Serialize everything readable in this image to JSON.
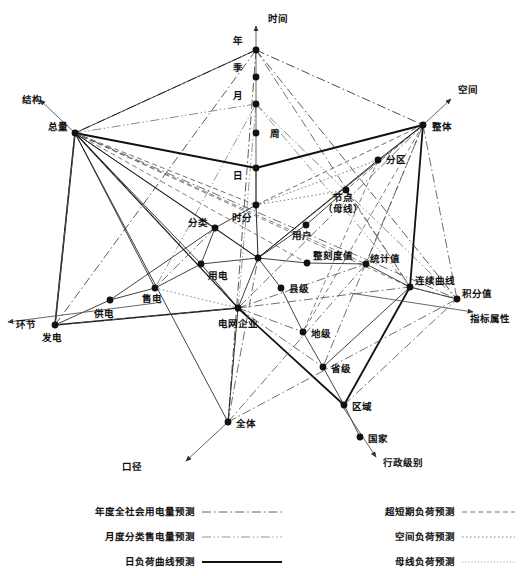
{
  "figure": {
    "title": "",
    "type": "multi-axis-network-diagram",
    "background_color": "#ffffff",
    "line_color": "#333333"
  },
  "axes": [
    {
      "id": "time",
      "label": "时间",
      "label_x": 268,
      "label_y": 22,
      "from": [
        256,
        210
      ],
      "to": [
        256,
        26
      ]
    },
    {
      "id": "structure",
      "label": "结构",
      "label_x": 22,
      "label_y": 103,
      "from": [
        75,
        133
      ],
      "to": [
        40,
        100
      ]
    },
    {
      "id": "space",
      "label": "空间",
      "label_x": 458,
      "label_y": 93,
      "from": [
        423,
        125
      ],
      "to": [
        451,
        99
      ]
    },
    {
      "id": "stage",
      "label": "环节",
      "label_x": 16,
      "label_y": 328,
      "from": [
        156,
        303
      ],
      "to": [
        8,
        322
      ]
    },
    {
      "id": "indicator",
      "label": "指标属性",
      "label_x": 470,
      "label_y": 322,
      "from": [
        350,
        293
      ],
      "to": [
        473,
        312
      ]
    },
    {
      "id": "caliber",
      "label": "口径",
      "label_x": 122,
      "label_y": 470,
      "from": [
        228,
        422
      ],
      "to": [
        186,
        461
      ]
    },
    {
      "id": "admin",
      "label": "行政级别",
      "label_x": 383,
      "label_y": 466,
      "from": [
        339,
        401
      ],
      "to": [
        376,
        457
      ]
    }
  ],
  "nodes": [
    {
      "id": "nian",
      "label": "年",
      "x": 256,
      "y": 50,
      "lx": 243,
      "ly": 44,
      "anchor": "end"
    },
    {
      "id": "ji",
      "label": "季",
      "x": 256,
      "y": 77,
      "lx": 243,
      "ly": 71,
      "anchor": "end"
    },
    {
      "id": "yue",
      "label": "月",
      "x": 256,
      "y": 104,
      "lx": 243,
      "ly": 99,
      "anchor": "end"
    },
    {
      "id": "zhou",
      "label": "周",
      "x": 256,
      "y": 133,
      "lx": 270,
      "ly": 137,
      "anchor": "start"
    },
    {
      "id": "ri",
      "label": "日",
      "x": 256,
      "y": 168,
      "lx": 243,
      "ly": 179,
      "anchor": "end"
    },
    {
      "id": "shifen",
      "label": "时分",
      "x": 256,
      "y": 205,
      "lx": 252,
      "ly": 221,
      "anchor": "end"
    },
    {
      "id": "zongliang",
      "label": "总量",
      "x": 75,
      "y": 133,
      "lx": 68,
      "ly": 130,
      "anchor": "end"
    },
    {
      "id": "zhengti",
      "label": "整体",
      "x": 423,
      "y": 125,
      "lx": 432,
      "ly": 130,
      "anchor": "start"
    },
    {
      "id": "fenqu",
      "label": "分区",
      "x": 378,
      "y": 160,
      "lx": 386,
      "ly": 163,
      "anchor": "start"
    },
    {
      "id": "jiedian",
      "label": "节点（母线）",
      "x": 346,
      "y": 190,
      "lx": 343,
      "ly": 207,
      "anchor": "middle"
    },
    {
      "id": "yonghu",
      "label": "用户",
      "x": 306,
      "y": 225,
      "lx": 302,
      "ly": 239,
      "anchor": "middle"
    },
    {
      "id": "fenlei",
      "label": "分类",
      "x": 215,
      "y": 228,
      "lx": 208,
      "ly": 226,
      "anchor": "end"
    },
    {
      "id": "yongdian",
      "label": "用电",
      "x": 201,
      "y": 264,
      "lx": 208,
      "ly": 279,
      "anchor": "start"
    },
    {
      "id": "shoudian",
      "label": "售电",
      "x": 155,
      "y": 288,
      "lx": 152,
      "ly": 302,
      "anchor": "middle"
    },
    {
      "id": "gongdian",
      "label": "供电",
      "x": 110,
      "y": 300,
      "lx": 104,
      "ly": 317,
      "anchor": "middle"
    },
    {
      "id": "fadian",
      "label": "发电",
      "x": 55,
      "y": 325,
      "lx": 52,
      "ly": 341,
      "anchor": "middle"
    },
    {
      "id": "hub",
      "label": "",
      "x": 258,
      "y": 258,
      "lx": 258,
      "ly": 258,
      "anchor": "middle"
    },
    {
      "id": "dianwang",
      "label": "电网企业",
      "x": 238,
      "y": 308,
      "lx": 238,
      "ly": 327,
      "anchor": "middle"
    },
    {
      "id": "xianji",
      "label": "县级",
      "x": 281,
      "y": 288,
      "lx": 289,
      "ly": 292,
      "anchor": "start"
    },
    {
      "id": "diji",
      "label": "地级",
      "x": 303,
      "y": 332,
      "lx": 311,
      "ly": 337,
      "anchor": "start"
    },
    {
      "id": "shengji",
      "label": "省级",
      "x": 323,
      "y": 367,
      "lx": 331,
      "ly": 372,
      "anchor": "start"
    },
    {
      "id": "quyu",
      "label": "区域",
      "x": 344,
      "y": 405,
      "lx": 352,
      "ly": 410,
      "anchor": "start"
    },
    {
      "id": "guojia",
      "label": "国家",
      "x": 360,
      "y": 437,
      "lx": 368,
      "ly": 442,
      "anchor": "start"
    },
    {
      "id": "zhengkedu",
      "label": "整刻度值",
      "x": 307,
      "y": 263,
      "lx": 333,
      "ly": 259,
      "anchor": "middle"
    },
    {
      "id": "tongji",
      "label": "统计值",
      "x": 366,
      "y": 264,
      "lx": 385,
      "ly": 262,
      "anchor": "middle"
    },
    {
      "id": "lianxu",
      "label": "连续曲线",
      "x": 410,
      "y": 287,
      "lx": 435,
      "ly": 284,
      "anchor": "middle"
    },
    {
      "id": "jifen",
      "label": "积分值",
      "x": 457,
      "y": 299,
      "lx": 477,
      "ly": 297,
      "anchor": "middle"
    },
    {
      "id": "quanti",
      "label": "全体",
      "x": 228,
      "y": 422,
      "lx": 236,
      "ly": 427,
      "anchor": "start"
    }
  ],
  "edges": [
    {
      "from": "nian",
      "to": "zongliang",
      "style": "dashdot",
      "weight": 1.0
    },
    {
      "from": "nian",
      "to": "zongliang",
      "style": "solid",
      "weight": 0.8
    },
    {
      "from": "nian",
      "to": "zhengti",
      "style": "dashdot",
      "weight": 1.0
    },
    {
      "from": "nian",
      "to": "jifen",
      "style": "dashdot",
      "weight": 0.9
    },
    {
      "from": "nian",
      "to": "quanti",
      "style": "dashdot",
      "weight": 0.9
    },
    {
      "from": "nian",
      "to": "fadian",
      "style": "dashdot",
      "weight": 0.9
    },
    {
      "from": "nian",
      "to": "lianxu",
      "style": "dashdot",
      "weight": 0.8
    },
    {
      "from": "yue",
      "to": "zongliang",
      "style": "dashdotdot",
      "weight": 0.9
    },
    {
      "from": "yue",
      "to": "jifen",
      "style": "dashdotdot",
      "weight": 0.9
    },
    {
      "from": "yue",
      "to": "lianxu",
      "style": "dashdotdot",
      "weight": 0.8
    },
    {
      "from": "yue",
      "to": "quanti",
      "style": "dashdotdot",
      "weight": 0.8
    },
    {
      "from": "yue",
      "to": "shoudian",
      "style": "dashdotdot",
      "weight": 0.8
    },
    {
      "from": "ri",
      "to": "zongliang",
      "style": "solid",
      "weight": 2.0
    },
    {
      "from": "ri",
      "to": "zhengti",
      "style": "solid",
      "weight": 2.0
    },
    {
      "from": "ri",
      "to": "shifen",
      "style": "solid",
      "weight": 0.9
    },
    {
      "from": "shifen",
      "to": "zongliang",
      "style": "dashed",
      "weight": 0.9
    },
    {
      "from": "shifen",
      "to": "zhengti",
      "style": "dashed",
      "weight": 0.9
    },
    {
      "from": "shifen",
      "to": "fenqu",
      "style": "dotted",
      "weight": 0.9
    },
    {
      "from": "shifen",
      "to": "hub",
      "style": "solid",
      "weight": 0.9
    },
    {
      "from": "shifen",
      "to": "jiedian",
      "style": "dotted",
      "weight": 0.9
    },
    {
      "from": "shifen",
      "to": "fenlei",
      "style": "solid",
      "weight": 0.8
    },
    {
      "from": "zongliang",
      "to": "fenlei",
      "style": "solid",
      "weight": 0.8
    },
    {
      "from": "zongliang",
      "to": "fadian",
      "style": "solid",
      "weight": 1.6
    },
    {
      "from": "zongliang",
      "to": "fadian",
      "style": "dashed",
      "weight": 0.8
    },
    {
      "from": "zongliang",
      "to": "fadian",
      "style": "dashdot",
      "weight": 0.8
    },
    {
      "from": "zongliang",
      "to": "dianwang",
      "style": "solid",
      "weight": 1.2
    },
    {
      "from": "zongliang",
      "to": "dianwang",
      "style": "dashed",
      "weight": 0.8
    },
    {
      "from": "zongliang",
      "to": "yongdian",
      "style": "solid",
      "weight": 0.8
    },
    {
      "from": "zongliang",
      "to": "shoudian",
      "style": "solid",
      "weight": 0.8
    },
    {
      "from": "zongliang",
      "to": "hub",
      "style": "solid",
      "weight": 0.8
    },
    {
      "from": "zongliang",
      "to": "tongji",
      "style": "dashed",
      "weight": 0.8
    },
    {
      "from": "zongliang",
      "to": "zhengkedu",
      "style": "dashed",
      "weight": 0.8
    },
    {
      "from": "zongliang",
      "to": "lianxu",
      "style": "dashed",
      "weight": 0.8
    },
    {
      "from": "zongliang",
      "to": "jifen",
      "style": "dashdot",
      "weight": 0.8
    },
    {
      "from": "zongliang",
      "to": "quanti",
      "style": "solid",
      "weight": 0.8
    },
    {
      "from": "zhengti",
      "to": "fenqu",
      "style": "solid",
      "weight": 0.8
    },
    {
      "from": "zhengti",
      "to": "jiedian",
      "style": "dashed",
      "weight": 0.8
    },
    {
      "from": "zhengti",
      "to": "lianxu",
      "style": "solid",
      "weight": 1.8
    },
    {
      "from": "zhengti",
      "to": "jifen",
      "style": "dashdot",
      "weight": 0.8
    },
    {
      "from": "zhengti",
      "to": "tongji",
      "style": "dashed",
      "weight": 0.8
    },
    {
      "from": "zhengti",
      "to": "diji",
      "style": "dashed",
      "weight": 0.8
    },
    {
      "from": "zhengti",
      "to": "shengji",
      "style": "dashdot",
      "weight": 0.8
    },
    {
      "from": "zhengti",
      "to": "hub",
      "style": "solid",
      "weight": 0.8
    },
    {
      "from": "zhengti",
      "to": "dianwang",
      "style": "dashdot",
      "weight": 0.8
    },
    {
      "from": "fenqu",
      "to": "hub",
      "style": "solid",
      "weight": 0.8
    },
    {
      "from": "fenqu",
      "to": "diji",
      "style": "dashed",
      "weight": 0.8
    },
    {
      "from": "jiedian",
      "to": "yonghu",
      "style": "solid",
      "weight": 0.8
    },
    {
      "from": "jiedian",
      "to": "lianxu",
      "style": "dashed",
      "weight": 0.8
    },
    {
      "from": "yonghu",
      "to": "hub",
      "style": "solid",
      "weight": 0.8
    },
    {
      "from": "hub",
      "to": "fenlei",
      "style": "solid",
      "weight": 0.8
    },
    {
      "from": "hub",
      "to": "yongdian",
      "style": "solid",
      "weight": 0.8
    },
    {
      "from": "hub",
      "to": "dianwang",
      "style": "solid",
      "weight": 0.8
    },
    {
      "from": "hub",
      "to": "xianji",
      "style": "solid",
      "weight": 0.8
    },
    {
      "from": "hub",
      "to": "zhengkedu",
      "style": "solid",
      "weight": 0.8
    },
    {
      "from": "fenlei",
      "to": "yongdian",
      "style": "solid",
      "weight": 0.8
    },
    {
      "from": "fenlei",
      "to": "gongdian",
      "style": "solid",
      "weight": 0.8
    },
    {
      "from": "fenlei",
      "to": "shoudian",
      "style": "dashdot",
      "weight": 0.8
    },
    {
      "from": "yongdian",
      "to": "shoudian",
      "style": "solid",
      "weight": 0.8
    },
    {
      "from": "yongdian",
      "to": "dianwang",
      "style": "solid",
      "weight": 0.8
    },
    {
      "from": "shoudian",
      "to": "gongdian",
      "style": "solid",
      "weight": 0.8
    },
    {
      "from": "shoudian",
      "to": "dianwang",
      "style": "dotted",
      "weight": 0.8
    },
    {
      "from": "gongdian",
      "to": "fadian",
      "style": "solid",
      "weight": 0.8
    },
    {
      "from": "fadian",
      "to": "dianwang",
      "style": "solid",
      "weight": 1.4
    },
    {
      "from": "fadian",
      "to": "dianwang",
      "style": "dashed",
      "weight": 0.8
    },
    {
      "from": "dianwang",
      "to": "diji",
      "style": "dashdot",
      "weight": 0.8
    },
    {
      "from": "dianwang",
      "to": "shengji",
      "style": "dashdot",
      "weight": 0.8
    },
    {
      "from": "dianwang",
      "to": "quyu",
      "style": "solid",
      "weight": 1.8
    },
    {
      "from": "dianwang",
      "to": "quanti",
      "style": "solid",
      "weight": 0.8
    },
    {
      "from": "dianwang",
      "to": "tongji",
      "style": "dashdot",
      "weight": 0.8
    },
    {
      "from": "dianwang",
      "to": "lianxu",
      "style": "dashdot",
      "weight": 0.8
    },
    {
      "from": "xianji",
      "to": "diji",
      "style": "solid",
      "weight": 0.8
    },
    {
      "from": "diji",
      "to": "shengji",
      "style": "solid",
      "weight": 0.8
    },
    {
      "from": "shengji",
      "to": "quyu",
      "style": "solid",
      "weight": 0.8
    },
    {
      "from": "shengji",
      "to": "lianxu",
      "style": "solid",
      "weight": 0.8
    },
    {
      "from": "quyu",
      "to": "lianxu",
      "style": "solid",
      "weight": 1.8
    },
    {
      "from": "quyu",
      "to": "jifen",
      "style": "dashdot",
      "weight": 0.8
    },
    {
      "from": "quyu",
      "to": "guojia",
      "style": "solid",
      "weight": 0.8
    },
    {
      "from": "zhengkedu",
      "to": "tongji",
      "style": "solid",
      "weight": 0.8
    },
    {
      "from": "tongji",
      "to": "lianxu",
      "style": "solid",
      "weight": 0.8
    },
    {
      "from": "lianxu",
      "to": "jifen",
      "style": "solid",
      "weight": 0.8
    },
    {
      "from": "lianxu",
      "to": "jifen",
      "style": "dashdot",
      "weight": 0.8
    },
    {
      "from": "quanti",
      "to": "tongji",
      "style": "dashdot",
      "weight": 0.8
    },
    {
      "from": "quanti",
      "to": "hub",
      "style": "dashdot",
      "weight": 0.8
    },
    {
      "from": "quanti",
      "to": "jifen",
      "style": "dashdot",
      "weight": 0.8
    }
  ],
  "legend": {
    "columns": [
      {
        "items": [
          {
            "label": "年度全社会用电量预测",
            "style": "dashdot",
            "color": "#555555",
            "width": 0.9
          },
          {
            "label": "月度分类售电量预测",
            "style": "dashdotdot",
            "color": "#888888",
            "width": 0.9
          },
          {
            "label": "日负荷曲线预测",
            "style": "solid",
            "color": "#111111",
            "width": 2.2
          }
        ]
      },
      {
        "items": [
          {
            "label": "超短期负荷预测",
            "style": "dashed",
            "color": "#666666",
            "width": 0.9
          },
          {
            "label": "空间负荷预测",
            "style": "dotted",
            "color": "#777777",
            "width": 0.9
          },
          {
            "label": "母线负荷预测",
            "style": "fine-dotted",
            "color": "#999999",
            "width": 0.8
          }
        ]
      }
    ]
  }
}
